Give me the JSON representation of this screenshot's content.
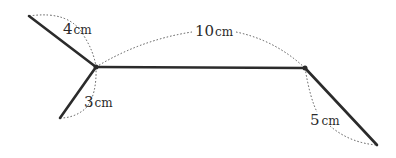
{
  "diagram": {
    "segments": [
      {
        "id": "upper-left",
        "length_label": "4",
        "unit": "cm"
      },
      {
        "id": "lower-left",
        "length_label": "3",
        "unit": "cm"
      },
      {
        "id": "middle",
        "length_label": "10",
        "unit": "cm"
      },
      {
        "id": "right",
        "length_label": "5",
        "unit": "cm"
      }
    ],
    "colors": {
      "line": "#2b2b2b",
      "dotted": "#555555",
      "text": "#2a2a2a"
    }
  }
}
